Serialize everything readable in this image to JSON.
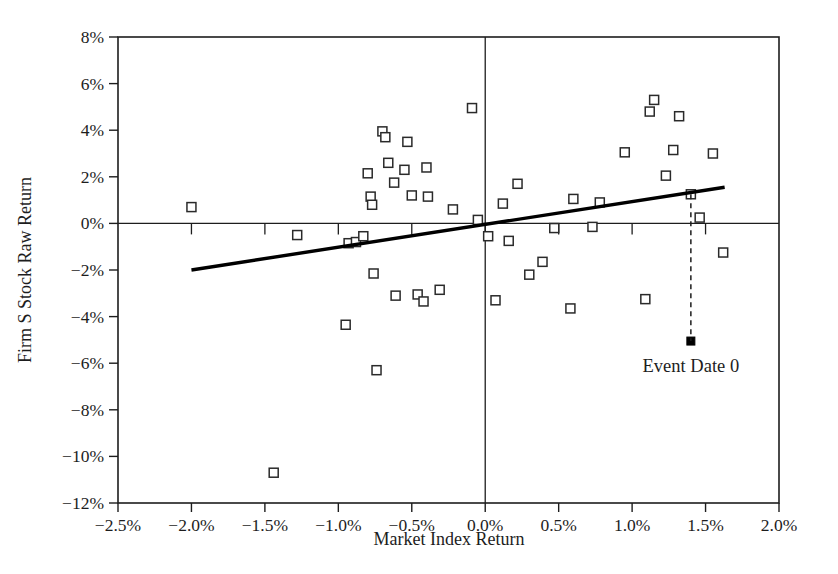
{
  "chart_data": {
    "type": "scatter",
    "title": "",
    "xlabel": "Market Index Return",
    "ylabel": "Firm S Stock Raw Return",
    "xlim": [
      -2.5,
      2.0
    ],
    "ylim": [
      -12,
      8
    ],
    "grid": false,
    "legend": "none",
    "x_tick_labels": [
      "-2.5%",
      "-2.0%",
      "-1.5%",
      "-1.0%",
      "-0.5%",
      "0.0%",
      "0.5%",
      "1.0%",
      "1.5%",
      "2.0%"
    ],
    "x_tick_values": [
      -2.5,
      -2.0,
      -1.5,
      -1.0,
      -0.5,
      0.0,
      0.5,
      1.0,
      1.5,
      2.0
    ],
    "y_tick_labels": [
      "8%",
      "6%",
      "4%",
      "2%",
      "0%",
      "-2%",
      "-4%",
      "-6%",
      "-8%",
      "-10%",
      "-12%"
    ],
    "y_tick_values": [
      8,
      6,
      4,
      2,
      0,
      -2,
      -4,
      -6,
      -8,
      -10,
      -12
    ],
    "series": [
      {
        "name": "Firm S daily returns",
        "marker": "open-square",
        "points": [
          [
            -2.0,
            0.7
          ],
          [
            -1.44,
            -10.7
          ],
          [
            -1.28,
            -0.5
          ],
          [
            -0.95,
            -4.35
          ],
          [
            -0.93,
            -0.85
          ],
          [
            -0.88,
            -0.8
          ],
          [
            -0.83,
            -0.55
          ],
          [
            -0.8,
            2.15
          ],
          [
            -0.78,
            1.15
          ],
          [
            -0.77,
            0.8
          ],
          [
            -0.76,
            -2.15
          ],
          [
            -0.74,
            -6.3
          ],
          [
            -0.7,
            3.95
          ],
          [
            -0.68,
            3.7
          ],
          [
            -0.66,
            2.6
          ],
          [
            -0.62,
            1.75
          ],
          [
            -0.61,
            -3.1
          ],
          [
            -0.55,
            2.3
          ],
          [
            -0.53,
            3.5
          ],
          [
            -0.5,
            1.2
          ],
          [
            -0.46,
            -3.05
          ],
          [
            -0.42,
            -3.35
          ],
          [
            -0.4,
            2.4
          ],
          [
            -0.39,
            1.15
          ],
          [
            -0.31,
            -2.85
          ],
          [
            -0.22,
            0.6
          ],
          [
            -0.09,
            4.95
          ],
          [
            -0.05,
            0.15
          ],
          [
            0.02,
            -0.55
          ],
          [
            0.07,
            -3.3
          ],
          [
            0.12,
            0.85
          ],
          [
            0.16,
            -0.75
          ],
          [
            0.22,
            1.7
          ],
          [
            0.3,
            -2.2
          ],
          [
            0.39,
            -1.65
          ],
          [
            0.47,
            -0.2
          ],
          [
            0.58,
            -3.65
          ],
          [
            0.6,
            1.05
          ],
          [
            0.73,
            -0.15
          ],
          [
            0.78,
            0.9
          ],
          [
            0.95,
            3.05
          ],
          [
            1.09,
            -3.25
          ],
          [
            1.12,
            4.8
          ],
          [
            1.15,
            5.3
          ],
          [
            1.23,
            2.05
          ],
          [
            1.28,
            3.15
          ],
          [
            1.32,
            4.6
          ],
          [
            1.4,
            1.25
          ],
          [
            1.46,
            0.25
          ],
          [
            1.55,
            3.0
          ],
          [
            1.62,
            -1.25
          ]
        ]
      },
      {
        "name": "Event Date 0",
        "marker": "filled-square",
        "points": [
          [
            1.4,
            -5.05
          ]
        ]
      }
    ],
    "fit_line": {
      "name": "regression-line",
      "x_start": -2.0,
      "y_start": -2.0,
      "x_end": 1.63,
      "y_end": 1.55
    },
    "annotations": [
      {
        "name": "event-date-annotation",
        "text": "Event Date 0",
        "x": 1.4,
        "y": -6.1,
        "leader_from": [
          1.4,
          1.25
        ],
        "leader_to": [
          1.4,
          -5.05
        ],
        "leader_style": "dashed"
      }
    ],
    "colors": {
      "axis": "#1d1d1d",
      "marker_stroke": "#2a2a2a",
      "marker_fill": "#ffffff",
      "event_marker_fill": "#000000",
      "fit_line": "#000000",
      "background": "#ffffff"
    }
  }
}
